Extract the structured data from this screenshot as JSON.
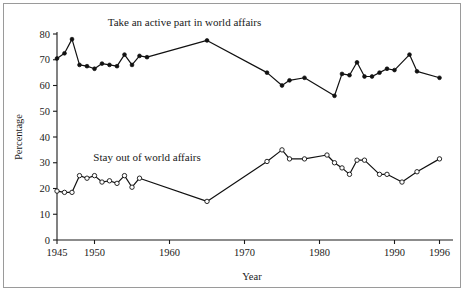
{
  "chart_data": {
    "type": "line",
    "title": "",
    "xlabel": "Year",
    "ylabel": "Percentage",
    "xlim": [
      1945,
      1997
    ],
    "ylim": [
      0,
      80
    ],
    "xticks": [
      1945,
      1950,
      1960,
      1970,
      1980,
      1990,
      1996
    ],
    "xtick_labels": [
      "1945",
      "1950",
      "1960",
      "1970",
      "1980",
      "1990",
      "1996"
    ],
    "yticks": [
      0,
      10,
      20,
      30,
      40,
      50,
      60,
      70,
      80
    ],
    "ytick_labels": [
      "0",
      "10",
      "20",
      "30",
      "40",
      "50",
      "60",
      "70",
      "80"
    ],
    "grid": false,
    "legend_position": "inline-annotation",
    "series": [
      {
        "name": "Take an active part in world affairs",
        "marker": "filled-circle",
        "label_x": 1962,
        "label_y": 83,
        "points": [
          [
            1945,
            70.5
          ],
          [
            1946,
            72.5
          ],
          [
            1947,
            78.0
          ],
          [
            1948,
            68.0
          ],
          [
            1949,
            67.5
          ],
          [
            1950,
            66.5
          ],
          [
            1951,
            68.5
          ],
          [
            1952,
            68.0
          ],
          [
            1953,
            67.5
          ],
          [
            1954,
            72.0
          ],
          [
            1955,
            68.0
          ],
          [
            1956,
            71.5
          ],
          [
            1957,
            71.0
          ],
          [
            1965,
            77.5
          ],
          [
            1973,
            65.0
          ],
          [
            1975,
            60.0
          ],
          [
            1976,
            62.0
          ],
          [
            1978,
            63.0
          ],
          [
            1982,
            56.0
          ],
          [
            1983,
            64.5
          ],
          [
            1984,
            64.0
          ],
          [
            1985,
            69.0
          ],
          [
            1986,
            63.5
          ],
          [
            1987,
            63.5
          ],
          [
            1988,
            65.0
          ],
          [
            1989,
            66.5
          ],
          [
            1990,
            66.0
          ],
          [
            1992,
            72.0
          ],
          [
            1993,
            65.5
          ],
          [
            1996,
            63.0
          ]
        ]
      },
      {
        "name": "Stay out of world affairs",
        "marker": "open-circle",
        "label_x": 1957,
        "label_y": 30.5,
        "points": [
          [
            1945,
            19.0
          ],
          [
            1946,
            18.5
          ],
          [
            1947,
            18.5
          ],
          [
            1948,
            25.0
          ],
          [
            1949,
            24.0
          ],
          [
            1950,
            25.0
          ],
          [
            1951,
            22.5
          ],
          [
            1952,
            23.0
          ],
          [
            1953,
            22.0
          ],
          [
            1954,
            25.0
          ],
          [
            1955,
            20.5
          ],
          [
            1956,
            24.0
          ],
          [
            1965,
            15.0
          ],
          [
            1973,
            30.5
          ],
          [
            1975,
            35.0
          ],
          [
            1976,
            31.5
          ],
          [
            1978,
            31.5
          ],
          [
            1981,
            33.0
          ],
          [
            1982,
            30.0
          ],
          [
            1983,
            28.0
          ],
          [
            1984,
            25.5
          ],
          [
            1985,
            31.0
          ],
          [
            1986,
            31.0
          ],
          [
            1988,
            25.5
          ],
          [
            1989,
            25.5
          ],
          [
            1991,
            22.5
          ],
          [
            1993,
            26.5
          ],
          [
            1996,
            31.5
          ]
        ]
      }
    ]
  }
}
